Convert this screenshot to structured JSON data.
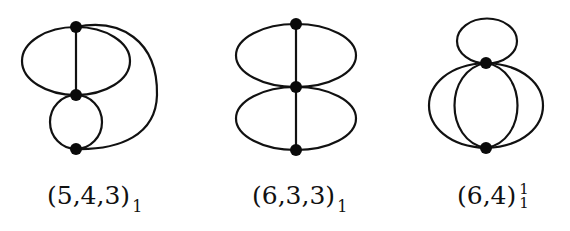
{
  "graphs": [
    {
      "id": "g1",
      "label": {
        "main": "(5,4,3)",
        "sub": "1"
      },
      "nodes": [
        {
          "name": "top",
          "x": 76,
          "y": 27
        },
        {
          "name": "middle",
          "x": 76,
          "y": 95
        },
        {
          "name": "bottom",
          "x": 76,
          "y": 149
        }
      ]
    },
    {
      "id": "g2",
      "label": {
        "main": "(6,3,3)",
        "sub": "1"
      },
      "nodes": [
        {
          "name": "top",
          "x": 296,
          "y": 24
        },
        {
          "name": "middle",
          "x": 296,
          "y": 87
        },
        {
          "name": "bottom",
          "x": 296,
          "y": 150
        }
      ]
    },
    {
      "id": "g3",
      "label": {
        "main": "(6,4)",
        "sub": "1",
        "sup": "1"
      },
      "nodes": [
        {
          "name": "top",
          "x": 486,
          "y": 63
        },
        {
          "name": "bottom",
          "x": 486,
          "y": 148
        }
      ]
    }
  ],
  "colors": {
    "stroke": "#111111",
    "node": "#0a0a0a",
    "background": "#ffffff"
  }
}
